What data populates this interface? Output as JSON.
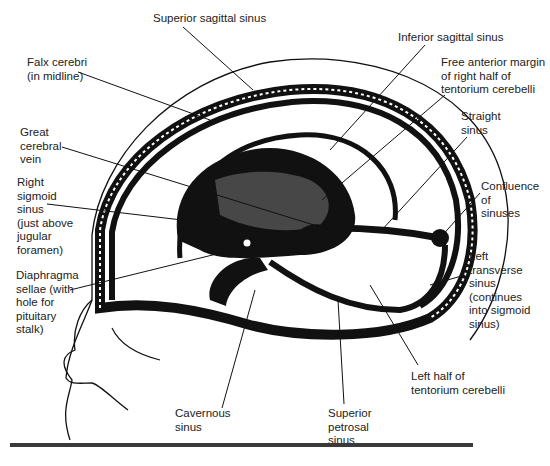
{
  "figure": {
    "labels": [
      {
        "id": "superior-sagittal-sinus",
        "text": "Superior sagittal sinus",
        "x": 153,
        "y": 12
      },
      {
        "id": "falx-cerebri",
        "text": "Falx cerebri\n(in midline)",
        "x": 27,
        "y": 56
      },
      {
        "id": "inferior-sagittal-sinus",
        "text": "Inferior sagittal sinus",
        "x": 398,
        "y": 31
      },
      {
        "id": "free-anterior-margin",
        "text": "Free anterior margin\nof right half of\ntentorium cerebelli",
        "x": 441,
        "y": 56
      },
      {
        "id": "straight-sinus",
        "text": "Straight\nsinus",
        "x": 461,
        "y": 110
      },
      {
        "id": "great-cerebral-vein",
        "text": "Great\ncerebral\nvein",
        "x": 20,
        "y": 126
      },
      {
        "id": "right-sigmoid-sinus",
        "text": "Right\nsigmoid\nsinus\n(just above\njugular\nforamen)",
        "x": 17,
        "y": 176
      },
      {
        "id": "confluence-of-sinuses",
        "text": "Confluence\nof\nsinuses",
        "x": 481,
        "y": 180
      },
      {
        "id": "diaphragma-sellae",
        "text": "Diaphragma\nsellae (with\nhole for\npituitary\nstalk)",
        "x": 16,
        "y": 269
      },
      {
        "id": "left-transverse-sinus",
        "text": "Left\ntransverse\nsinus\n(continues\ninto sigmoid\nsinus)",
        "x": 469,
        "y": 250
      },
      {
        "id": "left-half-tentorium",
        "text": "Left half of\ntentorium cerebelli",
        "x": 411,
        "y": 370
      },
      {
        "id": "cavernous-sinus",
        "text": "Cavernous\nsinus",
        "x": 175,
        "y": 407
      },
      {
        "id": "superior-petrosal-sinus",
        "text": "Superior\npetrosal\nsinus",
        "x": 328,
        "y": 407
      }
    ],
    "colors": {
      "ink": "#111111",
      "text": "#222222",
      "rule": "#3a3a3a",
      "background": "#ffffff"
    }
  }
}
